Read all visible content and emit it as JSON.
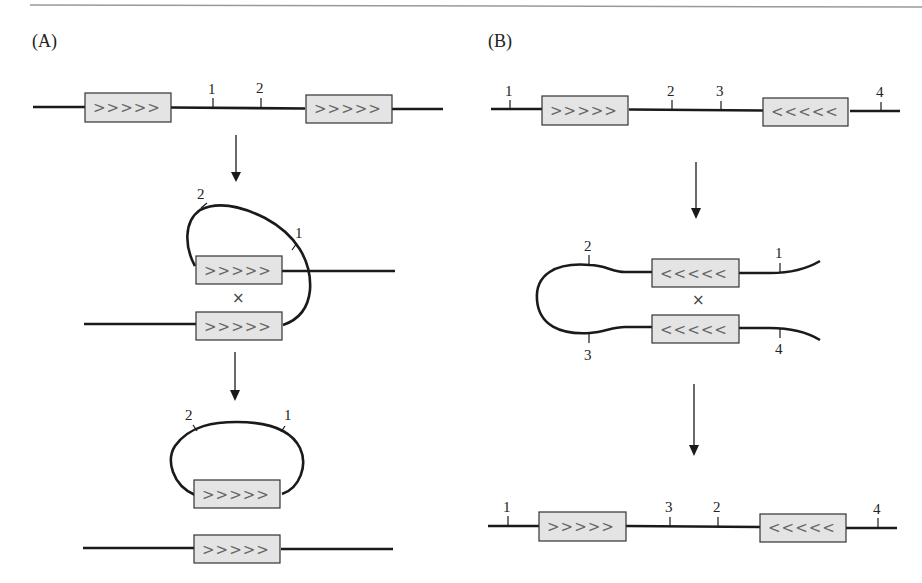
{
  "figure": {
    "top_rule_color": "#999999",
    "panels": [
      {
        "id": "A",
        "label": "(A)",
        "step1": {
          "labels": [
            "1",
            "2"
          ],
          "repeats": [
            ">>>>>",
            ">>>>>"
          ]
        },
        "step2": {
          "labels": [
            "2",
            "1"
          ],
          "repeats": [
            ">>>>>",
            ">>>>>"
          ],
          "crossover": "×"
        },
        "step3": {
          "labels": [
            "2",
            "1"
          ],
          "repeats": [
            ">>>>>",
            ">>>>>"
          ]
        }
      },
      {
        "id": "B",
        "label": "(B)",
        "step1": {
          "labels": [
            "1",
            "2",
            "3",
            "4"
          ],
          "repeats": [
            ">>>>>",
            "<<<<<"
          ]
        },
        "step2": {
          "labels": [
            "2",
            "1",
            "3",
            "4"
          ],
          "repeats": [
            "<<<<<",
            "<<<<<"
          ],
          "crossover": "×"
        },
        "step3": {
          "labels": [
            "1",
            "3",
            "2",
            "4"
          ],
          "repeats": [
            ">>>>>",
            "<<<<<"
          ]
        }
      }
    ],
    "colors": {
      "repeat_box_fill": "#e4e4e4",
      "repeat_box_stroke": "#333333",
      "dna": "#1a1a1a",
      "chevron": "#666666"
    }
  }
}
